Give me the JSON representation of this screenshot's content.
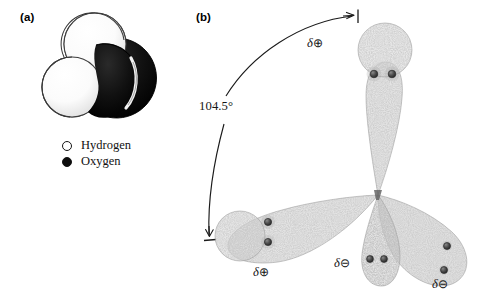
{
  "figure": {
    "panels": [
      {
        "id": "a",
        "label": "(a)",
        "caption_type": "space-filling-model"
      },
      {
        "id": "b",
        "label": "(b)",
        "caption_type": "orbital-model"
      }
    ]
  },
  "panel_a": {
    "label": "(a)",
    "model": "water-molecule-space-filling",
    "atoms": [
      {
        "element": "Oxygen",
        "shade": "black",
        "color": "#0d0d0d"
      },
      {
        "element": "Hydrogen",
        "shade": "white",
        "color": "#ffffff"
      },
      {
        "element": "Hydrogen",
        "shade": "white",
        "color": "#ffffff"
      }
    ],
    "legend": [
      {
        "label": "Hydrogen",
        "marker": "open-circle",
        "color": "#ffffff"
      },
      {
        "label": "Oxygen",
        "marker": "filled-circle",
        "color": "#0d0d0d"
      }
    ]
  },
  "panel_b": {
    "label": "(b)",
    "bond_angle": "104.5°",
    "lobes": [
      {
        "id": "top",
        "type": "bonding",
        "charge_label": "δ⊕",
        "delta": "δ",
        "sign": "⊕",
        "electrons": 2,
        "direction": "up"
      },
      {
        "id": "lower-left",
        "type": "bonding",
        "charge_label": "δ⊕",
        "delta": "δ",
        "sign": "⊕",
        "electrons": 2,
        "direction": "lower-left"
      },
      {
        "id": "lone-pair-center",
        "type": "lone-pair",
        "charge_label": "δ⊖",
        "delta": "δ",
        "sign": "⊖",
        "electrons": 2,
        "direction": "down"
      },
      {
        "id": "lone-pair-right",
        "type": "lone-pair",
        "charge_label": "δ⊖",
        "delta": "δ",
        "sign": "⊖",
        "electrons": 2,
        "direction": "lower-right"
      }
    ],
    "angle_arc": {
      "label": "104.5°",
      "style": "double-headed-arc"
    }
  },
  "colors": {
    "ink": "#151515",
    "oxygen": "#0d0d0d",
    "hydrogen": "#ffffff",
    "stipple": "#8f8f8f",
    "electron_dot": "#4a4a4a"
  }
}
